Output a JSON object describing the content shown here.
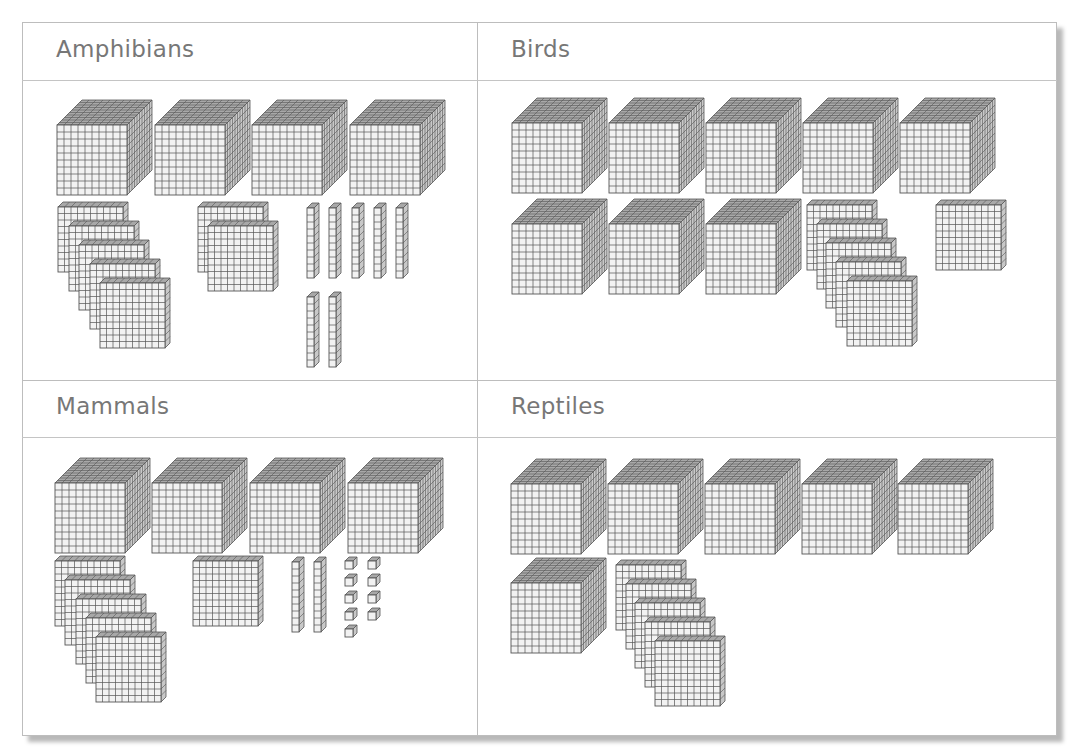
{
  "panels": [
    {
      "id": "amphibians",
      "title": "Amphibians",
      "counts": {
        "thousands": 4,
        "hundreds": 7,
        "tens": 7,
        "ones": 0
      },
      "value": 4770
    },
    {
      "id": "birds",
      "title": "Birds",
      "counts": {
        "thousands": 8,
        "hundreds": 6,
        "tens": 0,
        "ones": 0
      },
      "value": 8600
    },
    {
      "id": "mammals",
      "title": "Mammals",
      "counts": {
        "thousands": 4,
        "hundreds": 6,
        "tens": 2,
        "ones": 9
      },
      "value": 4629
    },
    {
      "id": "reptiles",
      "title": "Reptiles",
      "counts": {
        "thousands": 6,
        "hundreds": 5,
        "tens": 0,
        "ones": 0
      },
      "value": 6500
    }
  ],
  "layout": {
    "cubes": [
      {
        "panel": 0,
        "x": 57,
        "y": 100
      },
      {
        "panel": 0,
        "x": 155,
        "y": 100
      },
      {
        "panel": 0,
        "x": 252,
        "y": 100
      },
      {
        "panel": 0,
        "x": 350,
        "y": 100
      },
      {
        "panel": 1,
        "x": 512,
        "y": 98
      },
      {
        "panel": 1,
        "x": 609,
        "y": 98
      },
      {
        "panel": 1,
        "x": 706,
        "y": 98
      },
      {
        "panel": 1,
        "x": 803,
        "y": 98
      },
      {
        "panel": 1,
        "x": 900,
        "y": 98
      },
      {
        "panel": 1,
        "x": 512,
        "y": 199
      },
      {
        "panel": 1,
        "x": 609,
        "y": 199
      },
      {
        "panel": 1,
        "x": 706,
        "y": 199
      },
      {
        "panel": 2,
        "x": 55,
        "y": 458
      },
      {
        "panel": 2,
        "x": 152,
        "y": 458
      },
      {
        "panel": 2,
        "x": 250,
        "y": 458
      },
      {
        "panel": 2,
        "x": 348,
        "y": 458
      },
      {
        "panel": 3,
        "x": 511,
        "y": 459
      },
      {
        "panel": 3,
        "x": 608,
        "y": 459
      },
      {
        "panel": 3,
        "x": 705,
        "y": 459
      },
      {
        "panel": 3,
        "x": 802,
        "y": 459
      },
      {
        "panel": 3,
        "x": 898,
        "y": 459
      },
      {
        "panel": 3,
        "x": 511,
        "y": 558
      }
    ],
    "flats": [
      {
        "panel": 0,
        "x": 58,
        "y": 202
      },
      {
        "panel": 0,
        "x": 69,
        "y": 221
      },
      {
        "panel": 0,
        "x": 79,
        "y": 240
      },
      {
        "panel": 0,
        "x": 90,
        "y": 259
      },
      {
        "panel": 0,
        "x": 100,
        "y": 278
      },
      {
        "panel": 0,
        "x": 198,
        "y": 202
      },
      {
        "panel": 0,
        "x": 208,
        "y": 221
      },
      {
        "panel": 1,
        "x": 807,
        "y": 200
      },
      {
        "panel": 1,
        "x": 817,
        "y": 219
      },
      {
        "panel": 1,
        "x": 826,
        "y": 238
      },
      {
        "panel": 1,
        "x": 836,
        "y": 257
      },
      {
        "panel": 1,
        "x": 847,
        "y": 276
      },
      {
        "panel": 1,
        "x": 936,
        "y": 200
      },
      {
        "panel": 2,
        "x": 55,
        "y": 556
      },
      {
        "panel": 2,
        "x": 65,
        "y": 575
      },
      {
        "panel": 2,
        "x": 76,
        "y": 594
      },
      {
        "panel": 2,
        "x": 86,
        "y": 613
      },
      {
        "panel": 2,
        "x": 96,
        "y": 632
      },
      {
        "panel": 2,
        "x": 193,
        "y": 556
      },
      {
        "panel": 3,
        "x": 616,
        "y": 560
      },
      {
        "panel": 3,
        "x": 626,
        "y": 579
      },
      {
        "panel": 3,
        "x": 635,
        "y": 598
      },
      {
        "panel": 3,
        "x": 645,
        "y": 617
      },
      {
        "panel": 3,
        "x": 655,
        "y": 636
      }
    ],
    "rods": [
      {
        "panel": 0,
        "x": 307,
        "y": 203
      },
      {
        "panel": 0,
        "x": 329,
        "y": 203
      },
      {
        "panel": 0,
        "x": 352,
        "y": 203
      },
      {
        "panel": 0,
        "x": 374,
        "y": 203
      },
      {
        "panel": 0,
        "x": 396,
        "y": 203
      },
      {
        "panel": 0,
        "x": 307,
        "y": 292
      },
      {
        "panel": 0,
        "x": 329,
        "y": 292
      },
      {
        "panel": 2,
        "x": 292,
        "y": 557
      },
      {
        "panel": 2,
        "x": 314,
        "y": 557
      }
    ],
    "ones": [
      {
        "panel": 2,
        "x": 345,
        "y": 557
      },
      {
        "panel": 2,
        "x": 368,
        "y": 557
      },
      {
        "panel": 2,
        "x": 345,
        "y": 574
      },
      {
        "panel": 2,
        "x": 368,
        "y": 574
      },
      {
        "panel": 2,
        "x": 345,
        "y": 591
      },
      {
        "panel": 2,
        "x": 368,
        "y": 591
      },
      {
        "panel": 2,
        "x": 345,
        "y": 608
      },
      {
        "panel": 2,
        "x": 368,
        "y": 608
      },
      {
        "panel": 2,
        "x": 345,
        "y": 625
      }
    ]
  },
  "style": {
    "line_color": "#555555",
    "face_color": "#f2f2f2",
    "side_color": "#c8c8c8",
    "top_color": "#a8a8a8",
    "title_color": "#777777",
    "border_color": "#bdbdbd"
  },
  "chart_data": {
    "type": "table",
    "title": "",
    "categories": [
      "Amphibians",
      "Birds",
      "Mammals",
      "Reptiles"
    ],
    "series": [
      {
        "name": "Thousands (cubes)",
        "values": [
          4,
          8,
          4,
          6
        ]
      },
      {
        "name": "Hundreds (flats)",
        "values": [
          7,
          6,
          6,
          5
        ]
      },
      {
        "name": "Tens (rods)",
        "values": [
          7,
          0,
          2,
          0
        ]
      },
      {
        "name": "Ones (unit cubes)",
        "values": [
          0,
          0,
          9,
          0
        ]
      }
    ],
    "values": [
      4770,
      8600,
      4629,
      6500
    ]
  }
}
